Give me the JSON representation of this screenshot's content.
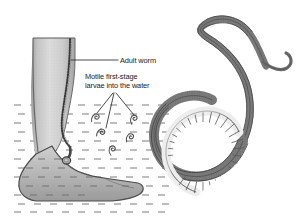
{
  "figure": {
    "type": "parasitology-illustration",
    "background_color": "#ffffff"
  },
  "labels": {
    "adult_worm": {
      "text": "Adult worm",
      "leader": "horizontal-line-to-leg"
    },
    "larvae": {
      "line1": "Motile first-stage",
      "line2": "larvae into the water",
      "leader": "three-branch-fan-to-larvae"
    }
  },
  "panels": {
    "left": {
      "name": "leg-in-water-diagram",
      "elements": [
        "human-lower-leg-and-foot",
        "emerging-adult-worm-track",
        "skin-blister-at-ankle",
        "water-dash-field",
        "first-stage-larvae"
      ],
      "larvae_count": 5
    },
    "right": {
      "name": "adult-worm-specimen",
      "elements": [
        "worm-body-s-curve",
        "worm-tail-hook",
        "coiled-uterus-segments"
      ]
    }
  },
  "colors": {
    "ink": "#1a1a1a",
    "skin_light": "#d2d2d2",
    "skin_mid": "#b4b4b4",
    "skin_dark": "#989898",
    "outline": "#3c3c3c",
    "water_dash": "#8a8a8a",
    "worm_body": "#8e8e8e",
    "worm_outline": "#2e2e2e",
    "uterus_fill": "#e8e8e8"
  }
}
